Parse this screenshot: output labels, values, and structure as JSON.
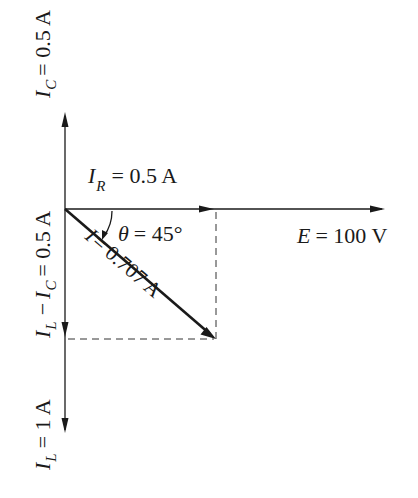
{
  "diagram": {
    "type": "phasor-diagram",
    "origin": {
      "x": 65,
      "y": 209
    },
    "labels": {
      "ic": {
        "symbol": "I",
        "sub": "C",
        "value": "= 0.5 A"
      },
      "ir": {
        "symbol": "I",
        "sub": "R",
        "value": "= 0.5 A"
      },
      "il_minus_ic": {
        "symbol1": "I",
        "sub1": "L",
        "minus": "−",
        "symbol2": "I",
        "sub2": "C",
        "value": "= 0.5 A"
      },
      "il": {
        "symbol": "I",
        "sub": "L",
        "value": "= 1 A"
      },
      "theta": {
        "symbol": "θ",
        "value": "= 45°"
      },
      "i_total": {
        "symbol": "I",
        "value": "= 0.707 A"
      },
      "e": {
        "symbol": "E",
        "value": "= 100 V"
      }
    },
    "colors": {
      "ink": "#1a1a1a",
      "background": "#ffffff"
    }
  }
}
